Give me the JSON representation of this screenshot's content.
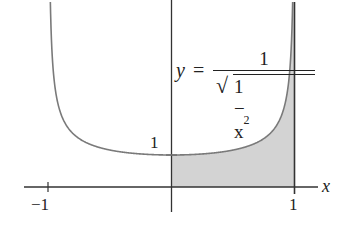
{
  "chart_data": {
    "type": "area",
    "title": "",
    "function": "y = 1/sqrt(1 - x^2)",
    "formula_label": {
      "lhs": "y",
      "eq": "=",
      "numerator": "1",
      "denominator_radicand": "1 − x",
      "exponent": "2"
    },
    "xlabel": "x",
    "ylabel": "",
    "x_ticks": [
      {
        "value": -1,
        "label": "−1"
      },
      {
        "value": 1,
        "label": "1"
      }
    ],
    "y_ticks": [
      {
        "value": 1,
        "label": "1"
      }
    ],
    "xlim": [
      -1.2,
      1.2
    ],
    "ylim": [
      -0.7,
      5.8
    ],
    "shaded_region": {
      "from_x": 0,
      "to_x": 1,
      "under": "curve",
      "color": "#d3d3d3"
    },
    "vertical_asymptotes": [
      -1,
      1
    ],
    "sample_points": [
      {
        "x": -0.99,
        "y": 7.09
      },
      {
        "x": -0.9,
        "y": 2.29
      },
      {
        "x": -0.7,
        "y": 1.4
      },
      {
        "x": -0.5,
        "y": 1.15
      },
      {
        "x": 0,
        "y": 1.0
      },
      {
        "x": 0.5,
        "y": 1.15
      },
      {
        "x": 0.7,
        "y": 1.4
      },
      {
        "x": 0.9,
        "y": 2.29
      },
      {
        "x": 0.99,
        "y": 7.09
      }
    ],
    "grid": false,
    "legend": null
  },
  "colors": {
    "curve": "#7a7a7a",
    "axes": "#333333",
    "shade": "#d3d3d3",
    "text": "#222222"
  }
}
